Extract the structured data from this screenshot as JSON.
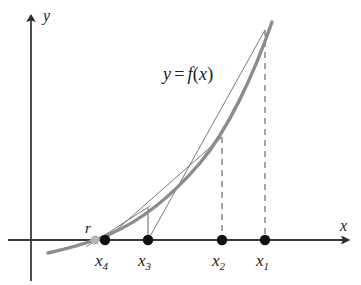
{
  "figure": {
    "axes": {
      "x_label": "x",
      "y_label": "y",
      "x_axis_y": 240,
      "y_axis_x": 31,
      "x_axis_start": 8,
      "x_axis_end": 352,
      "y_axis_top": 13,
      "y_axis_bottom": 281
    },
    "curve": {
      "label": "y = f(x)",
      "label_parts": {
        "y": "y",
        "equals": "=",
        "f": "f",
        "open": "(",
        "x": "x",
        "close": ")"
      },
      "label_x": 165,
      "label_y": 68,
      "color": "#8c8c8c",
      "stroke_width": 3.2,
      "path": "M 48,253 C 70,248 92,242 110,235 C 140,223 172,198 200,164 C 226,132 252,78 271,23"
    },
    "root": {
      "label": "r",
      "label_x": 85,
      "label_y": 225,
      "x": 95,
      "y": 240,
      "radius": 4.6,
      "color": "#b3b3b3"
    },
    "points": [
      {
        "name": "x4",
        "label": "x",
        "subscript": "4",
        "x": 105,
        "y": 240,
        "label_x": 96,
        "label_y": 252,
        "curve_y": 232
      },
      {
        "name": "x3",
        "label": "x",
        "subscript": "3",
        "x": 148,
        "y": 240,
        "label_x": 139,
        "label_y": 252,
        "curve_y": 208
      },
      {
        "name": "x2",
        "label": "x",
        "subscript": "2",
        "x": 222,
        "y": 240,
        "label_x": 213,
        "label_y": 252,
        "curve_y": 137
      },
      {
        "name": "x1",
        "label": "x",
        "subscript": "1",
        "x": 265,
        "y": 240,
        "label_x": 256,
        "label_y": 252,
        "curve_y": 40
      }
    ],
    "point_radius": 5.2,
    "point_color": "#111111",
    "verticals": [
      {
        "name": "vertical-x3-solid",
        "x": 148,
        "y_top": 208,
        "y_bottom": 240,
        "dashed": false
      },
      {
        "name": "vertical-x2-dashed",
        "x": 222,
        "y_top": 137,
        "y_bottom": 240,
        "dashed": true
      },
      {
        "name": "vertical-x1-dashed",
        "x": 265,
        "y_top": 30,
        "y_bottom": 240,
        "dashed": true
      }
    ],
    "secants": [
      {
        "name": "secant-x1-x2-to-x3",
        "x1": 265,
        "y1": 30,
        "x2": 148,
        "y2": 240
      },
      {
        "name": "secant-x2-x3-to-x4",
        "x1": 222,
        "y1": 137,
        "x2": 105,
        "y2": 240
      },
      {
        "name": "secant-x3-x4-tail",
        "x1": 148,
        "y1": 208,
        "x2": 88,
        "y2": 246
      }
    ],
    "line_color": "#5a5a5a",
    "axis_color": "#3a3a3a",
    "dash_color": "#909090"
  }
}
